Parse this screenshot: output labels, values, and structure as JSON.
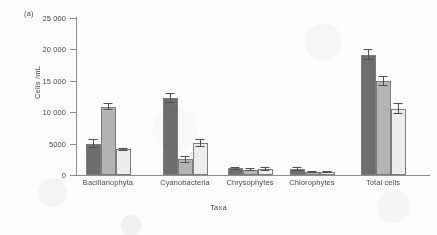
{
  "panel_label": "(a)",
  "chart_data": {
    "type": "bar",
    "title": "",
    "xlabel": "Taxa",
    "ylabel": "Cells /mL",
    "ylim": [
      0,
      25000
    ],
    "grid": false,
    "legend": "none",
    "ytick_labels": [
      "25 000",
      "20 000",
      "15 000",
      "10 000",
      "5000",
      "0"
    ],
    "ytick_values": [
      25000,
      20000,
      15000,
      10000,
      5000,
      0
    ],
    "categories": [
      "Bacillariophyta",
      "Cyanobacteria",
      "Chrysophytes",
      "Chlorophytes",
      "Total cells"
    ],
    "series": [
      {
        "name": "series-1",
        "color": "#6e6e6e",
        "values": [
          5000,
          12300,
          1050,
          900,
          19150
        ],
        "errors": [
          700,
          800,
          300,
          300,
          900
        ]
      },
      {
        "name": "series-2",
        "color": "#b4b4b4",
        "values": [
          10900,
          2500,
          850,
          450,
          14950
        ],
        "errors": [
          600,
          600,
          250,
          200,
          800
        ]
      },
      {
        "name": "series-3",
        "color": "#ececec",
        "values": [
          4100,
          5050,
          900,
          450,
          10550
        ],
        "errors": [
          250,
          650,
          300,
          200,
          900
        ]
      }
    ]
  }
}
